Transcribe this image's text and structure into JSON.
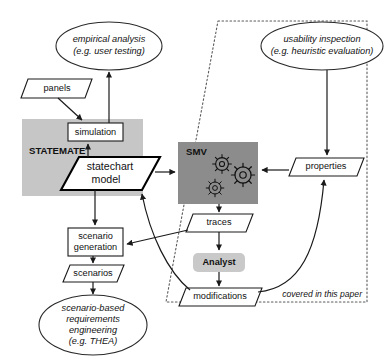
{
  "diagram": {
    "caption": "covered in this paper",
    "group_labels": {
      "statemate": "STATEMATE",
      "smv": "SMV"
    },
    "colors": {
      "statemate_band": "#c6c6c6",
      "smv_box": "#8c8c8c",
      "analyst_box": "#c9c9c9",
      "line": "#1a1a1a",
      "dotted_boundary": "#5a5a5a",
      "background": "#ffffff"
    },
    "nodes": [
      {
        "id": "empirical-analysis",
        "shape": "ellipse",
        "lines": [
          "empirical analysis",
          "(e.g. user testing)"
        ]
      },
      {
        "id": "usability-inspection",
        "shape": "ellipse",
        "lines": [
          "usability inspection",
          "(e.g. heuristic evaluation)"
        ]
      },
      {
        "id": "panels",
        "shape": "parallelogram",
        "lines": [
          "panels"
        ]
      },
      {
        "id": "simulation",
        "shape": "rect",
        "lines": [
          "simulation"
        ]
      },
      {
        "id": "statechart-model",
        "shape": "parallelogram",
        "lines": [
          "statechart",
          "model"
        ]
      },
      {
        "id": "smv",
        "shape": "filled-rect",
        "lines": [
          "SMV"
        ]
      },
      {
        "id": "properties",
        "shape": "parallelogram",
        "lines": [
          "properties"
        ]
      },
      {
        "id": "traces",
        "shape": "parallelogram",
        "lines": [
          "traces"
        ]
      },
      {
        "id": "analyst",
        "shape": "rounded-rect",
        "lines": [
          "Analyst"
        ]
      },
      {
        "id": "modifications",
        "shape": "parallelogram",
        "lines": [
          "modifications"
        ]
      },
      {
        "id": "scenario-generation",
        "shape": "rect",
        "lines": [
          "scenario",
          "generation"
        ]
      },
      {
        "id": "scenarios",
        "shape": "parallelogram",
        "lines": [
          "scenarios"
        ]
      },
      {
        "id": "scenario-based-re",
        "shape": "ellipse",
        "lines": [
          "scenario-based",
          "requirements",
          "engineering",
          "(e.g. THEA)"
        ]
      }
    ],
    "edges": [
      {
        "from": "simulation",
        "to": "empirical-analysis"
      },
      {
        "from": "panels",
        "to": "simulation"
      },
      {
        "from": "statechart-model",
        "to": "simulation"
      },
      {
        "from": "statechart-model",
        "to": "smv"
      },
      {
        "from": "properties",
        "to": "smv"
      },
      {
        "from": "usability-inspection",
        "to": "properties"
      },
      {
        "from": "smv",
        "to": "traces"
      },
      {
        "from": "traces",
        "to": "analyst"
      },
      {
        "from": "analyst",
        "to": "modifications"
      },
      {
        "from": "modifications",
        "to": "properties"
      },
      {
        "from": "modifications",
        "to": "statechart-model"
      },
      {
        "from": "traces",
        "to": "scenario-generation"
      },
      {
        "from": "statechart-model",
        "to": "scenario-generation"
      },
      {
        "from": "scenario-generation",
        "to": "scenarios"
      },
      {
        "from": "scenarios",
        "to": "scenario-based-re"
      }
    ]
  },
  "text": {
    "empirical_analysis_l1": "empirical analysis",
    "empirical_analysis_l2": "(e.g. user testing)",
    "usability_inspection_l1": "usability inspection",
    "usability_inspection_l2": "(e.g. heuristic evaluation)",
    "panels": "panels",
    "simulation": "simulation",
    "statemate": "STATEMATE",
    "statechart_l1": "statechart",
    "statechart_l2": "model",
    "smv": "SMV",
    "properties": "properties",
    "traces": "traces",
    "analyst": "Analyst",
    "modifications": "modifications",
    "scenario_gen_l1": "scenario",
    "scenario_gen_l2": "generation",
    "scenarios": "scenarios",
    "sbre_l1": "scenario-based",
    "sbre_l2": "requirements",
    "sbre_l3": "engineering",
    "sbre_l4": "(e.g. THEA)",
    "covered": "covered in this paper"
  }
}
